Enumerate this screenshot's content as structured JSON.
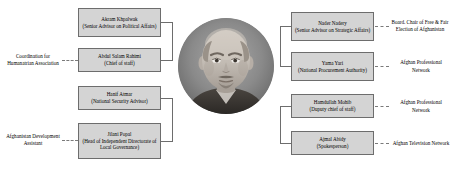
{
  "diagram": {
    "type": "organizational-relationship-chart",
    "center": {
      "portrait_alt": "central-figure-portrait"
    },
    "left_nodes": [
      {
        "name": "Akram Khpalwak",
        "role": "(Senior Advisor on Political Affairs)"
      },
      {
        "name": "Abdul Salam Rahimi",
        "role": "(Chief of staff)"
      },
      {
        "name": "Hanif Atmar",
        "role": "(National Security Advisor)"
      },
      {
        "name": "Jilani Popal",
        "role": "(Head of Independent Directorate of Local Governance)"
      }
    ],
    "right_nodes": [
      {
        "name": "Nader Nadery",
        "role": "(Senior Advisor on Strategic Affairs)"
      },
      {
        "name": "Yama Yari",
        "role": "(National Procurement Authority)"
      },
      {
        "name": "Hamdullah Mohib",
        "role": "(Duputy chief of staff)"
      },
      {
        "name": "Ajmal Abidy",
        "role": "(Spokesperson)"
      }
    ],
    "left_labels": [
      "Coordination for Humanatrian Association",
      "Afghanistan Development Assistant"
    ],
    "right_labels": [
      "Board. Chair of Free & Fair Election of Afghanistan",
      "Afghan Professional Network",
      "Afghan Professional Network",
      "Afghan Television Network"
    ],
    "colors": {
      "node_fill": "#d4d4d4",
      "node_border": "#6d6d6d",
      "connector": "#6d6d6d",
      "background": "#ffffff"
    }
  }
}
